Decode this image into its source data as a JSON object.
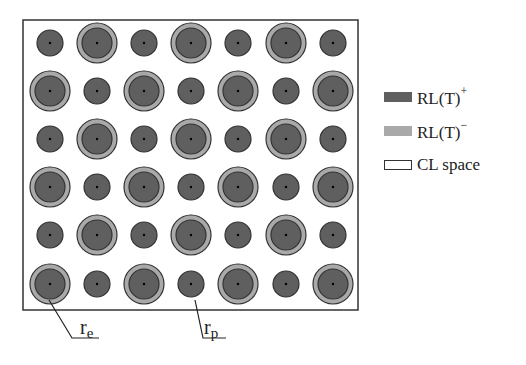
{
  "figure": {
    "box": {
      "x": 23,
      "y": 20,
      "width": 335,
      "height": 290
    },
    "colors": {
      "rl_plus": "#5f5f5f",
      "rl_minus": "#a9a9a9",
      "cl_space": "#ffffff",
      "outline": "#333333"
    },
    "grid": {
      "columns": [
        50,
        97,
        144,
        191,
        238,
        286,
        333
      ],
      "rows": [
        43,
        91,
        139,
        187,
        235,
        284
      ],
      "small_radius": 13,
      "inner_radius": 15,
      "outer_radius": 20,
      "first_row_starts_with": "small"
    },
    "annotations": [
      {
        "label_main": "r",
        "label_sub": "e",
        "label_x": 80,
        "label_y": 338,
        "leader": [
          [
            49,
            300
          ],
          [
            72,
            338
          ],
          [
            99,
            338
          ]
        ]
      },
      {
        "label_main": "r",
        "label_sub": "p",
        "label_x": 204,
        "label_y": 338,
        "leader": [
          [
            195,
            300
          ],
          [
            203,
            338
          ],
          [
            226,
            338
          ]
        ]
      }
    ]
  },
  "legend": {
    "items": [
      {
        "name": "rl-plus",
        "label": "RL(T)",
        "sup": "+",
        "swatch": "dark"
      },
      {
        "name": "rl-minus",
        "label": "RL(T)",
        "sup": "−",
        "swatch": "light"
      },
      {
        "name": "cl-space",
        "label": "CL space",
        "sup": "",
        "swatch": "empty"
      }
    ]
  }
}
